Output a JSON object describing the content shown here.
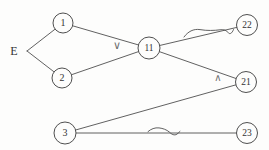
{
  "diagram": {
    "kind": "and-or-game-tree",
    "background_color": "#fdfdfc",
    "line_color": "#4f4f4f",
    "node_fill_color": "#fdfdfc",
    "node_text_color": "#333333",
    "operator_color": "#6e6e6e",
    "root_label": {
      "text": "E",
      "x": 14,
      "y": 51,
      "size": 12
    },
    "root_junction": {
      "x": 27,
      "y": 51
    },
    "nodes": [
      {
        "id": "1",
        "label": "1",
        "x": 63,
        "y": 23,
        "r": 10,
        "font_size": 10
      },
      {
        "id": "2",
        "label": "2",
        "x": 62,
        "y": 78,
        "r": 10,
        "font_size": 10
      },
      {
        "id": "11",
        "label": "11",
        "x": 149,
        "y": 48,
        "r": 11,
        "font_size": 9.5
      },
      {
        "id": "22",
        "label": "22",
        "x": 247,
        "y": 25,
        "r": 10.5,
        "font_size": 9.5
      },
      {
        "id": "21",
        "label": "21",
        "x": 246,
        "y": 82,
        "r": 10.5,
        "font_size": 9.5
      },
      {
        "id": "3",
        "label": "3",
        "x": 65,
        "y": 133,
        "r": 11,
        "font_size": 10
      },
      {
        "id": "23",
        "label": "23",
        "x": 247,
        "y": 133,
        "r": 10.5,
        "font_size": 9.5
      }
    ],
    "edges": [
      {
        "from": "root",
        "to": "1"
      },
      {
        "from": "root",
        "to": "2"
      },
      {
        "from": "1",
        "to": "11"
      },
      {
        "from": "2",
        "to": "11"
      },
      {
        "from": "11",
        "to": "22",
        "mark": "squiggle"
      },
      {
        "from": "11",
        "to": "21"
      },
      {
        "from": "3",
        "to": "21"
      },
      {
        "from": "3",
        "to": "23",
        "mark": "squiggle"
      }
    ],
    "operator_labels": [
      {
        "name": "or-symbol",
        "text": "∨",
        "x": 117,
        "y": 49,
        "size": 11
      },
      {
        "name": "and-symbol",
        "text": "∧",
        "x": 218,
        "y": 81,
        "size": 10
      }
    ],
    "squiggle_marks": [
      {
        "edge": "11-22",
        "path": "M184,37 C188,31.5 193.5,28.6 200,29.6 C207,30.8 214,30.6 220,29.8 C224,29.2 226.5,30.3 228,32.5 C229.6,34.7 232,33.6 233.5,29.6"
      },
      {
        "edge": "3-23",
        "path": "M148,131.6 C151,128.9 155,127.4 159,127.9 C163,128.4 166.5,129.6 169.5,132.2 C171.5,134.3 174.5,135.9 177,134.1 C178.3,133.1 179.2,132.2 180,131.4"
      }
    ]
  }
}
